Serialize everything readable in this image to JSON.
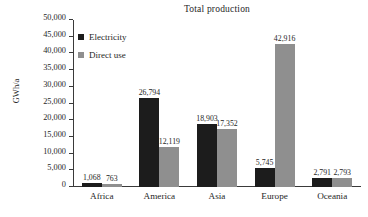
{
  "chart_data": {
    "type": "bar",
    "title": "Total production",
    "xlabel": "",
    "ylabel": "GWh/a",
    "ylim": [
      0,
      50000
    ],
    "grid": false,
    "legend_position": "top-left-inside",
    "categories": [
      "Africa",
      "America",
      "Asia",
      "Europe",
      "Oceania"
    ],
    "ytick_labels": [
      "0",
      "5,000",
      "10,000",
      "15,000",
      "20,000",
      "25,000",
      "30,000",
      "35,000",
      "40,000",
      "45,000",
      "50,000"
    ],
    "ytick_values": [
      0,
      5000,
      10000,
      15000,
      20000,
      25000,
      30000,
      35000,
      40000,
      45000,
      50000
    ],
    "series": [
      {
        "name": "Electricity",
        "color": "#1c1c1c",
        "values": [
          1068,
          26794,
          18903,
          5745,
          2791
        ],
        "labels": [
          "1,068",
          "26,794",
          "18,903",
          "5,745",
          "2,791"
        ]
      },
      {
        "name": "Direct use",
        "color": "#8f8f8f",
        "values": [
          763,
          12119,
          17352,
          42916,
          2793
        ],
        "labels": [
          "763",
          "12,119",
          "17,352",
          "42,916",
          "2,793"
        ]
      }
    ]
  }
}
